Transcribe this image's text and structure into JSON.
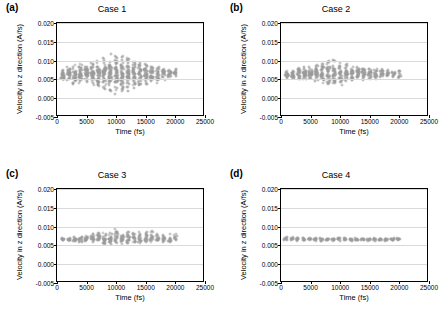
{
  "figure": {
    "panels": [
      {
        "tag": "(a)",
        "title": "Case 1",
        "xlabel": "Time (fs)",
        "ylabel": "Velocity in z direction (A/fs)",
        "xticks": [
          "0",
          "5000",
          "10000",
          "15000",
          "20000",
          "25000"
        ],
        "yticks": [
          "-0.005",
          "0.000",
          "0.005",
          "0.010",
          "0.015",
          "0.020"
        ]
      },
      {
        "tag": "(b)",
        "title": "Case 2",
        "xlabel": "Time (fs)",
        "ylabel": "Velocity in z direction (A/fs)",
        "xticks": [
          "0",
          "5000",
          "10000",
          "15000",
          "20000",
          "25000"
        ],
        "yticks": [
          "-0.005",
          "0.000",
          "0.005",
          "0.010",
          "0.015",
          "0.020"
        ]
      },
      {
        "tag": "(c)",
        "title": "Case 3",
        "xlabel": "Time (fs)",
        "ylabel": "Velocity in z direction (A/fs)",
        "xticks": [
          "0",
          "5000",
          "10000",
          "15000",
          "20000",
          "25000"
        ],
        "yticks": [
          "-0.005",
          "0.000",
          "0.005",
          "0.010",
          "0.015",
          "0.020"
        ]
      },
      {
        "tag": "(d)",
        "title": "Case 4",
        "xlabel": "Time (fs)",
        "ylabel": "Velocity in z direction (A/fs)",
        "xticks": [
          "0",
          "5000",
          "10000",
          "15000",
          "20000",
          "25000"
        ],
        "yticks": [
          "-0.005",
          "0.000",
          "0.005",
          "0.010",
          "0.015",
          "0.020"
        ]
      }
    ]
  },
  "chart_data": [
    {
      "type": "scatter",
      "title": "Case 1",
      "panel": "(a)",
      "xlabel": "Time (fs)",
      "ylabel": "Velocity in z direction (A/fs)",
      "xlim": [
        0,
        25000
      ],
      "ylim": [
        -0.005,
        0.02
      ],
      "xticks": [
        0,
        5000,
        10000,
        15000,
        20000,
        25000
      ],
      "yticks": [
        -0.005,
        0.0,
        0.005,
        0.01,
        0.015,
        0.02
      ],
      "grid": "horizontal",
      "marker": "open-circle",
      "marker_color": "#9a9a9a",
      "legend": "none",
      "description": "Dense vertical bands of scattered velocity samples clustered at regular time intervals; spread widest near 8000-12000 fs.",
      "clusters": [
        {
          "x": 1000,
          "y_mean": 0.0062,
          "y_min": 0.0045,
          "y_max": 0.008,
          "n": 28
        },
        {
          "x": 2000,
          "y_mean": 0.0063,
          "y_min": 0.0042,
          "y_max": 0.0083,
          "n": 30
        },
        {
          "x": 3000,
          "y_mean": 0.0063,
          "y_min": 0.0038,
          "y_max": 0.0088,
          "n": 32
        },
        {
          "x": 4000,
          "y_mean": 0.0064,
          "y_min": 0.0035,
          "y_max": 0.0092,
          "n": 34
        },
        {
          "x": 5000,
          "y_mean": 0.0064,
          "y_min": 0.0032,
          "y_max": 0.0096,
          "n": 36
        },
        {
          "x": 6000,
          "y_mean": 0.0065,
          "y_min": 0.0028,
          "y_max": 0.0102,
          "n": 38
        },
        {
          "x": 7000,
          "y_mean": 0.0065,
          "y_min": 0.0024,
          "y_max": 0.0108,
          "n": 40
        },
        {
          "x": 8000,
          "y_mean": 0.0066,
          "y_min": 0.0018,
          "y_max": 0.0118,
          "n": 44
        },
        {
          "x": 9000,
          "y_mean": 0.0066,
          "y_min": 0.0014,
          "y_max": 0.0125,
          "n": 46
        },
        {
          "x": 10000,
          "y_mean": 0.0066,
          "y_min": 0.001,
          "y_max": 0.0128,
          "n": 48
        },
        {
          "x": 11000,
          "y_mean": 0.0066,
          "y_min": 0.0012,
          "y_max": 0.0122,
          "n": 46
        },
        {
          "x": 12000,
          "y_mean": 0.0066,
          "y_min": 0.0016,
          "y_max": 0.0115,
          "n": 42
        },
        {
          "x": 13000,
          "y_mean": 0.0066,
          "y_min": 0.0022,
          "y_max": 0.0108,
          "n": 38
        },
        {
          "x": 14000,
          "y_mean": 0.0066,
          "y_min": 0.0026,
          "y_max": 0.0102,
          "n": 36
        },
        {
          "x": 15000,
          "y_mean": 0.0066,
          "y_min": 0.003,
          "y_max": 0.0098,
          "n": 34
        },
        {
          "x": 16000,
          "y_mean": 0.0066,
          "y_min": 0.0034,
          "y_max": 0.0094,
          "n": 30
        },
        {
          "x": 17000,
          "y_mean": 0.0066,
          "y_min": 0.0038,
          "y_max": 0.009,
          "n": 26
        },
        {
          "x": 18000,
          "y_mean": 0.0066,
          "y_min": 0.0042,
          "y_max": 0.0086,
          "n": 22
        },
        {
          "x": 19000,
          "y_mean": 0.0066,
          "y_min": 0.0046,
          "y_max": 0.0082,
          "n": 18
        },
        {
          "x": 20000,
          "y_mean": 0.0066,
          "y_min": 0.005,
          "y_max": 0.008,
          "n": 14
        }
      ]
    },
    {
      "type": "scatter",
      "title": "Case 2",
      "panel": "(b)",
      "xlabel": "Time (fs)",
      "ylabel": "Velocity in z direction (A/fs)",
      "xlim": [
        0,
        25000
      ],
      "ylim": [
        -0.005,
        0.02
      ],
      "xticks": [
        0,
        5000,
        10000,
        15000,
        20000,
        25000
      ],
      "yticks": [
        -0.005,
        0.0,
        0.005,
        0.01,
        0.015,
        0.02
      ],
      "grid": "horizontal",
      "marker": "open-circle",
      "marker_color": "#9a9a9a",
      "legend": "none",
      "description": "Narrower vertical bands than Case 1, centered near 0.0065 A/fs, with slightly larger spread between 7000 and 12000 fs.",
      "clusters": [
        {
          "x": 1000,
          "y_mean": 0.0064,
          "y_min": 0.0052,
          "y_max": 0.0076,
          "n": 20
        },
        {
          "x": 2000,
          "y_mean": 0.0064,
          "y_min": 0.005,
          "y_max": 0.0078,
          "n": 22
        },
        {
          "x": 3000,
          "y_mean": 0.0065,
          "y_min": 0.0048,
          "y_max": 0.0082,
          "n": 24
        },
        {
          "x": 4000,
          "y_mean": 0.0065,
          "y_min": 0.0046,
          "y_max": 0.0085,
          "n": 26
        },
        {
          "x": 5000,
          "y_mean": 0.0065,
          "y_min": 0.0044,
          "y_max": 0.0088,
          "n": 28
        },
        {
          "x": 6000,
          "y_mean": 0.0065,
          "y_min": 0.004,
          "y_max": 0.0092,
          "n": 30
        },
        {
          "x": 7000,
          "y_mean": 0.0065,
          "y_min": 0.0036,
          "y_max": 0.0098,
          "n": 32
        },
        {
          "x": 8000,
          "y_mean": 0.0065,
          "y_min": 0.003,
          "y_max": 0.0105,
          "n": 34
        },
        {
          "x": 9000,
          "y_mean": 0.0065,
          "y_min": 0.0028,
          "y_max": 0.0108,
          "n": 34
        },
        {
          "x": 10000,
          "y_mean": 0.0065,
          "y_min": 0.0032,
          "y_max": 0.01,
          "n": 32
        },
        {
          "x": 11000,
          "y_mean": 0.0065,
          "y_min": 0.0036,
          "y_max": 0.0095,
          "n": 30
        },
        {
          "x": 12000,
          "y_mean": 0.0065,
          "y_min": 0.004,
          "y_max": 0.009,
          "n": 28
        },
        {
          "x": 13000,
          "y_mean": 0.0065,
          "y_min": 0.0044,
          "y_max": 0.0086,
          "n": 26
        },
        {
          "x": 14000,
          "y_mean": 0.0065,
          "y_min": 0.0046,
          "y_max": 0.0084,
          "n": 24
        },
        {
          "x": 15000,
          "y_mean": 0.0065,
          "y_min": 0.0048,
          "y_max": 0.0082,
          "n": 22
        },
        {
          "x": 16000,
          "y_mean": 0.0065,
          "y_min": 0.005,
          "y_max": 0.008,
          "n": 20
        },
        {
          "x": 17000,
          "y_mean": 0.0065,
          "y_min": 0.0052,
          "y_max": 0.0078,
          "n": 18
        },
        {
          "x": 18000,
          "y_mean": 0.0065,
          "y_min": 0.0054,
          "y_max": 0.0076,
          "n": 14
        },
        {
          "x": 19000,
          "y_mean": 0.0065,
          "y_min": 0.0055,
          "y_max": 0.0075,
          "n": 12
        },
        {
          "x": 20000,
          "y_mean": 0.0064,
          "y_min": 0.005,
          "y_max": 0.0074,
          "n": 10
        }
      ]
    },
    {
      "type": "scatter",
      "title": "Case 3",
      "panel": "(c)",
      "xlabel": "Time (fs)",
      "ylabel": "Velocity in z direction (A/fs)",
      "xlim": [
        0,
        25000
      ],
      "ylim": [
        -0.005,
        0.02
      ],
      "xticks": [
        0,
        5000,
        10000,
        15000,
        20000,
        25000
      ],
      "yticks": [
        -0.005,
        0.0,
        0.005,
        0.01,
        0.015,
        0.02
      ],
      "grid": "horizontal",
      "marker": "open-circle",
      "marker_color": "#9a9a9a",
      "legend": "none",
      "description": "Tight vertical bands around 0.0065-0.0070 A/fs, widening modestly after 6000 fs, with a few outliers near 0.010.",
      "clusters": [
        {
          "x": 1000,
          "y_mean": 0.0066,
          "y_min": 0.0062,
          "y_max": 0.007,
          "n": 10
        },
        {
          "x": 2000,
          "y_mean": 0.0066,
          "y_min": 0.006,
          "y_max": 0.0072,
          "n": 12
        },
        {
          "x": 3000,
          "y_mean": 0.0066,
          "y_min": 0.0059,
          "y_max": 0.0074,
          "n": 14
        },
        {
          "x": 4000,
          "y_mean": 0.0066,
          "y_min": 0.0058,
          "y_max": 0.0075,
          "n": 14
        },
        {
          "x": 5000,
          "y_mean": 0.0067,
          "y_min": 0.0056,
          "y_max": 0.0078,
          "n": 16
        },
        {
          "x": 6000,
          "y_mean": 0.0067,
          "y_min": 0.0054,
          "y_max": 0.0082,
          "n": 18
        },
        {
          "x": 7000,
          "y_mean": 0.0067,
          "y_min": 0.0052,
          "y_max": 0.0086,
          "n": 20
        },
        {
          "x": 8000,
          "y_mean": 0.0067,
          "y_min": 0.005,
          "y_max": 0.009,
          "n": 22
        },
        {
          "x": 9000,
          "y_mean": 0.0067,
          "y_min": 0.005,
          "y_max": 0.0092,
          "n": 22
        },
        {
          "x": 10000,
          "y_mean": 0.0068,
          "y_min": 0.005,
          "y_max": 0.0095,
          "n": 22
        },
        {
          "x": 11000,
          "y_mean": 0.0068,
          "y_min": 0.0052,
          "y_max": 0.0092,
          "n": 20
        },
        {
          "x": 12000,
          "y_mean": 0.0068,
          "y_min": 0.0052,
          "y_max": 0.009,
          "n": 20
        },
        {
          "x": 13000,
          "y_mean": 0.0068,
          "y_min": 0.0054,
          "y_max": 0.009,
          "n": 18
        },
        {
          "x": 14000,
          "y_mean": 0.0068,
          "y_min": 0.0054,
          "y_max": 0.0092,
          "n": 18
        },
        {
          "x": 15000,
          "y_mean": 0.0068,
          "y_min": 0.0054,
          "y_max": 0.0096,
          "n": 18
        },
        {
          "x": 16000,
          "y_mean": 0.0068,
          "y_min": 0.0055,
          "y_max": 0.0092,
          "n": 16
        },
        {
          "x": 17000,
          "y_mean": 0.0068,
          "y_min": 0.0056,
          "y_max": 0.009,
          "n": 16
        },
        {
          "x": 18000,
          "y_mean": 0.0068,
          "y_min": 0.0056,
          "y_max": 0.0088,
          "n": 14
        },
        {
          "x": 19000,
          "y_mean": 0.0069,
          "y_min": 0.0058,
          "y_max": 0.0086,
          "n": 12
        },
        {
          "x": 20000,
          "y_mean": 0.0069,
          "y_min": 0.006,
          "y_max": 0.0082,
          "n": 10
        }
      ]
    },
    {
      "type": "scatter",
      "title": "Case 4",
      "panel": "(d)",
      "xlabel": "Time (fs)",
      "ylabel": "Velocity in z direction (A/fs)",
      "xlim": [
        0,
        25000
      ],
      "ylim": [
        -0.005,
        0.02
      ],
      "xticks": [
        0,
        5000,
        10000,
        15000,
        20000,
        25000
      ],
      "yticks": [
        -0.005,
        0.0,
        0.005,
        0.01,
        0.015,
        0.02
      ],
      "grid": "horizontal",
      "marker": "open-circle",
      "marker_color": "#9a9a9a",
      "legend": "none",
      "description": "Very tight, nearly constant band of points at about 0.0066 A/fs across the full time range, slightly wider early on.",
      "clusters": [
        {
          "x": 800,
          "y_mean": 0.0068,
          "y_min": 0.0062,
          "y_max": 0.0074,
          "n": 10
        },
        {
          "x": 1800,
          "y_mean": 0.0067,
          "y_min": 0.0062,
          "y_max": 0.0072,
          "n": 10
        },
        {
          "x": 2800,
          "y_mean": 0.0067,
          "y_min": 0.0062,
          "y_max": 0.0072,
          "n": 10
        },
        {
          "x": 3800,
          "y_mean": 0.0066,
          "y_min": 0.0062,
          "y_max": 0.0071,
          "n": 10
        },
        {
          "x": 4800,
          "y_mean": 0.0066,
          "y_min": 0.0062,
          "y_max": 0.0071,
          "n": 10
        },
        {
          "x": 5800,
          "y_mean": 0.0066,
          "y_min": 0.0061,
          "y_max": 0.0071,
          "n": 10
        },
        {
          "x": 6800,
          "y_mean": 0.0066,
          "y_min": 0.0061,
          "y_max": 0.0071,
          "n": 10
        },
        {
          "x": 7800,
          "y_mean": 0.0066,
          "y_min": 0.0061,
          "y_max": 0.0071,
          "n": 10
        },
        {
          "x": 8800,
          "y_mean": 0.0066,
          "y_min": 0.0061,
          "y_max": 0.007,
          "n": 10
        },
        {
          "x": 9800,
          "y_mean": 0.0066,
          "y_min": 0.0061,
          "y_max": 0.007,
          "n": 10
        },
        {
          "x": 10800,
          "y_mean": 0.0066,
          "y_min": 0.0061,
          "y_max": 0.007,
          "n": 10
        },
        {
          "x": 11800,
          "y_mean": 0.0066,
          "y_min": 0.0061,
          "y_max": 0.007,
          "n": 10
        },
        {
          "x": 12800,
          "y_mean": 0.0066,
          "y_min": 0.0061,
          "y_max": 0.007,
          "n": 10
        },
        {
          "x": 13800,
          "y_mean": 0.0066,
          "y_min": 0.0061,
          "y_max": 0.007,
          "n": 10
        },
        {
          "x": 14800,
          "y_mean": 0.0066,
          "y_min": 0.0061,
          "y_max": 0.007,
          "n": 10
        },
        {
          "x": 15800,
          "y_mean": 0.0066,
          "y_min": 0.0061,
          "y_max": 0.007,
          "n": 10
        },
        {
          "x": 16800,
          "y_mean": 0.0066,
          "y_min": 0.0061,
          "y_max": 0.007,
          "n": 10
        },
        {
          "x": 17800,
          "y_mean": 0.0066,
          "y_min": 0.0062,
          "y_max": 0.007,
          "n": 10
        },
        {
          "x": 18800,
          "y_mean": 0.0066,
          "y_min": 0.0062,
          "y_max": 0.007,
          "n": 10
        },
        {
          "x": 19800,
          "y_mean": 0.0066,
          "y_min": 0.0062,
          "y_max": 0.007,
          "n": 10
        }
      ]
    }
  ]
}
